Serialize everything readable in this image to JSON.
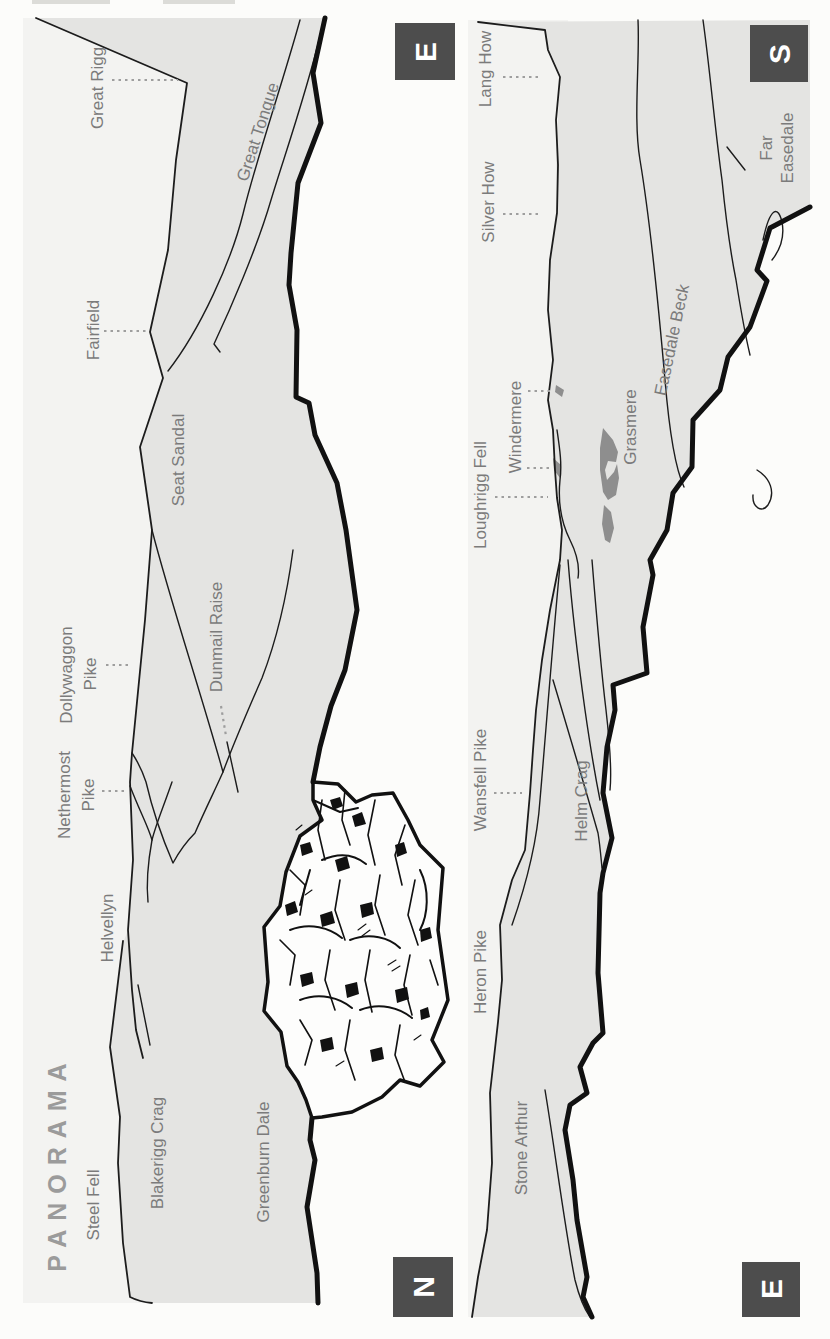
{
  "page": {
    "title": "PANORAMA"
  },
  "colors": {
    "terrain": "#e4e4e2",
    "sky": "#f3f3f1",
    "line": "#1c1c1c",
    "lake": "#8e8e8e",
    "label_gray": "#7b7b7b",
    "title_gray": "#9b9b9b",
    "badge_bg": "#4d4d4d",
    "badge_text": "#ffffff"
  },
  "panels": [
    {
      "id": "panorama-east-to-north",
      "compass_top": "E",
      "compass_bottom": "N",
      "labels": {
        "great_rigg": "Great Rigg",
        "great_tongue": "Great Tongue",
        "fairfield": "Fairfield",
        "seat_sandal": "Seat Sandal",
        "dunmail_raise": "Dunmail Raise",
        "dollywaggon_line1": "Dollywaggon",
        "dollywaggon_line2": "Pike",
        "nethermost_line1": "Nethermost",
        "nethermost_line2": "Pike",
        "helvellyn": "Helvellyn",
        "steel_fell": "Steel Fell",
        "blakerigg_crag": "Blakerigg Crag",
        "greenburn_dale": "Greenburn Dale"
      }
    },
    {
      "id": "panorama-south-to-east",
      "compass_top": "S",
      "compass_bottom": "E",
      "labels": {
        "lang_how": "Lang How",
        "silver_how": "Silver How",
        "far_easedale_line1": "Far",
        "far_easedale_line2": "Easedale",
        "windermere": "Windermere",
        "loughrigg_fell": "Loughrigg Fell",
        "grasmere": "Grasmere",
        "easedale_beck": "Easedale Beck",
        "wansfell_pike": "Wansfell Pike",
        "helm_crag": "Helm Crag",
        "heron_pike": "Heron Pike",
        "stone_arthur": "Stone Arthur"
      }
    }
  ]
}
